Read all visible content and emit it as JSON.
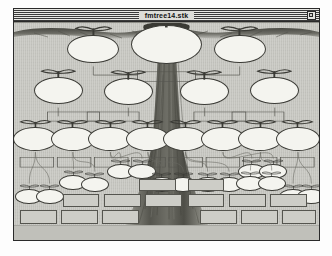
{
  "window": {
    "title": "fmtree14.stk",
    "zoom_box": "zoom-box",
    "style": "classic-mac-window"
  },
  "colors": {
    "window_frame": "#2a2a2a",
    "titlebar_stripes": "#3a3a3a",
    "titlebar_bg": "#ddddd8",
    "canvas_bg": "#c4c4be",
    "bubble_fill": "#f4f4ef",
    "bubble_stroke": "#3b3b36",
    "label_fill": "#cdcdc7",
    "label_stroke": "#55554f",
    "foliage": "#4a4a44",
    "trunk": "#6a6a62",
    "ground": "#c0c0ba"
  },
  "chart_data": {
    "type": "diagram",
    "title": "fmtree14.stk",
    "subtype": "family-tree",
    "generations": [
      {
        "index": 0,
        "name": "root-generation",
        "bubble_count": 3,
        "bubble_radius": 16,
        "bubbles": [
          {
            "id": "g0-n0",
            "cx": 43,
            "cy": 27,
            "r": 12,
            "label": ""
          },
          {
            "id": "g0-n1",
            "cx": 50,
            "cy": 27,
            "r": 17,
            "label": ""
          },
          {
            "id": "g0-n2",
            "cx": 57,
            "cy": 27,
            "r": 12,
            "label": ""
          }
        ]
      },
      {
        "index": 1,
        "name": "second-generation",
        "bubble_count": 4,
        "bubble_radius": 12
      },
      {
        "index": 2,
        "name": "third-generation",
        "bubble_count": 8,
        "bubble_radius": 10
      },
      {
        "index": 3,
        "name": "fourth-generation",
        "bubble_count": 16,
        "bubble_radius": 6
      }
    ],
    "label_boxes_total": 28,
    "labels_filled": 0,
    "xlabel": "",
    "ylabel": "",
    "legend": []
  },
  "tree": {
    "row0": [
      {
        "x": 26.0,
        "y": 12.0,
        "r": 8.5
      },
      {
        "x": 50.0,
        "y": 10.0,
        "r": 11.5
      },
      {
        "x": 74.0,
        "y": 12.0,
        "r": 8.5
      }
    ],
    "row1": [
      {
        "x": 14.5,
        "y": 31.0,
        "r": 8.0
      },
      {
        "x": 37.5,
        "y": 31.5,
        "r": 8.0
      },
      {
        "x": 62.5,
        "y": 31.5,
        "r": 8.0
      },
      {
        "x": 85.5,
        "y": 31.0,
        "r": 8.0
      }
    ],
    "row2": [
      {
        "x": 7.0,
        "y": 53.5,
        "r": 7.2
      },
      {
        "x": 19.3,
        "y": 53.5,
        "r": 7.2
      },
      {
        "x": 31.6,
        "y": 53.5,
        "r": 7.2
      },
      {
        "x": 43.9,
        "y": 53.5,
        "r": 7.2
      },
      {
        "x": 56.2,
        "y": 53.5,
        "r": 7.2
      },
      {
        "x": 68.5,
        "y": 53.5,
        "r": 7.2
      },
      {
        "x": 80.8,
        "y": 53.5,
        "r": 7.2
      },
      {
        "x": 93.1,
        "y": 53.5,
        "r": 7.2
      }
    ],
    "row3": [
      {
        "x": 5.0,
        "y": 80.0,
        "r": 4.6
      },
      {
        "x": 11.7,
        "y": 80.0,
        "r": 4.6
      },
      {
        "x": 19.5,
        "y": 73.5,
        "r": 4.6
      },
      {
        "x": 26.5,
        "y": 74.5,
        "r": 4.6
      },
      {
        "x": 35.0,
        "y": 68.5,
        "r": 4.6
      },
      {
        "x": 42.0,
        "y": 68.5,
        "r": 4.6
      },
      {
        "x": 48.5,
        "y": 74.5,
        "r": 4.6
      },
      {
        "x": 55.5,
        "y": 74.5,
        "r": 4.6
      },
      {
        "x": 63.5,
        "y": 74.5,
        "r": 4.6
      },
      {
        "x": 70.5,
        "y": 74.5,
        "r": 4.6
      },
      {
        "x": 78.0,
        "y": 68.5,
        "r": 4.6
      },
      {
        "x": 85.0,
        "y": 68.5,
        "r": 4.6
      },
      {
        "x": 77.5,
        "y": 74.0,
        "r": 4.6
      },
      {
        "x": 84.5,
        "y": 74.0,
        "r": 4.6
      },
      {
        "x": 91.5,
        "y": 80.0,
        "r": 4.6
      },
      {
        "x": 97.5,
        "y": 80.0,
        "r": 4.6
      }
    ]
  }
}
